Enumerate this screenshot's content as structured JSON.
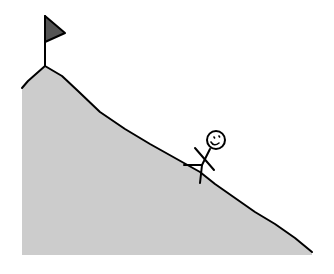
{
  "illustration": {
    "description": "Stick figure climbing a steep mountain slope toward a flag at the summit",
    "colors": {
      "background": "#ffffff",
      "mountain_fill": "#cccccc",
      "outline": "#000000",
      "flag_fill": "#555555"
    },
    "elements": {
      "mountain": "mountain",
      "flag": "flag",
      "stick_figure": "stick-figure",
      "face": "smiling-face"
    }
  }
}
